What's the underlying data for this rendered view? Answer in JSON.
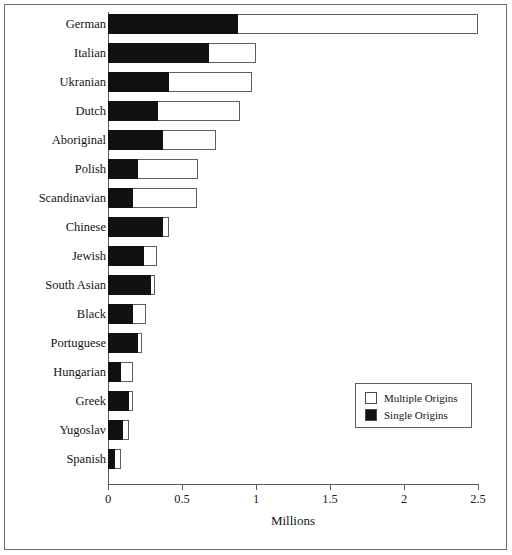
{
  "chart_data": {
    "type": "bar",
    "orientation": "horizontal",
    "stacked": true,
    "title": "",
    "xlabel": "Millions",
    "ylabel": "",
    "xlim": [
      0,
      2.5
    ],
    "xticks": [
      "0",
      "0.5",
      "1",
      "1.5",
      "2",
      "2.5"
    ],
    "xtick_values": [
      0,
      0.5,
      1,
      1.5,
      2,
      2.5
    ],
    "grid": false,
    "legend_position": "inside-lower-right",
    "categories": [
      "German",
      "Italian",
      "Ukranian",
      "Dutch",
      "Aboriginal",
      "Polish",
      "Scandinavian",
      "Chinese",
      "Jewish",
      "South Asian",
      "Black",
      "Portuguese",
      "Hungarian",
      "Greek",
      "Yugoslav",
      "Spanish"
    ],
    "series": [
      {
        "name": "Single Origins",
        "color": "#111111",
        "values": [
          0.88,
          0.68,
          0.41,
          0.34,
          0.37,
          0.2,
          0.17,
          0.37,
          0.24,
          0.29,
          0.17,
          0.2,
          0.09,
          0.14,
          0.1,
          0.05
        ]
      },
      {
        "name": "Multiple Origins",
        "color": "#ffffff",
        "values": [
          1.62,
          0.32,
          0.56,
          0.55,
          0.36,
          0.41,
          0.43,
          0.04,
          0.09,
          0.03,
          0.09,
          0.03,
          0.08,
          0.03,
          0.04,
          0.04
        ]
      }
    ],
    "totals": [
      2.5,
      1.0,
      0.97,
      0.89,
      0.73,
      0.61,
      0.6,
      0.41,
      0.33,
      0.32,
      0.26,
      0.23,
      0.17,
      0.17,
      0.14,
      0.09
    ]
  },
  "axis": {
    "x_title": "Millions",
    "ticks": [
      {
        "label": "0",
        "value": 0
      },
      {
        "label": "0.5",
        "value": 0.5
      },
      {
        "label": "1",
        "value": 1
      },
      {
        "label": "1.5",
        "value": 1.5
      },
      {
        "label": "2",
        "value": 2
      },
      {
        "label": "2.5",
        "value": 2.5
      }
    ]
  },
  "legend": {
    "entries": [
      {
        "label": "Multiple Origins",
        "swatch": "white"
      },
      {
        "label": "Single Origins",
        "swatch": "black"
      }
    ]
  }
}
